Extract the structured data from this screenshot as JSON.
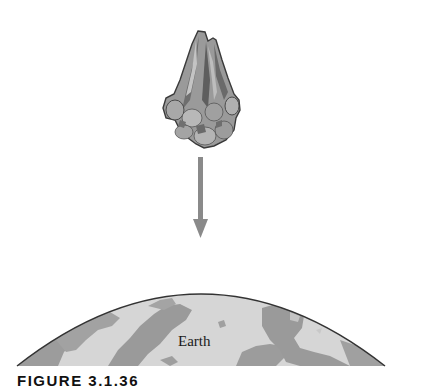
{
  "figure": {
    "caption_label": "FIGURE 3.1.36",
    "earth_label": "Earth",
    "objects": [
      {
        "name": "meteoroid",
        "description": "falling rock / asteroid fragment"
      },
      {
        "name": "arrow",
        "direction": "down"
      },
      {
        "name": "earth",
        "description": "curved surface of the Earth with continents"
      }
    ],
    "colors": {
      "background": "#ffffff",
      "rock_dark": "#5a5a5a",
      "rock_mid": "#8c8c8c",
      "rock_light": "#b5b5b5",
      "arrow": "#8a8a8a",
      "ocean": "#d9d9d9",
      "land": "#9a9a9a",
      "outline": "#333333"
    }
  }
}
